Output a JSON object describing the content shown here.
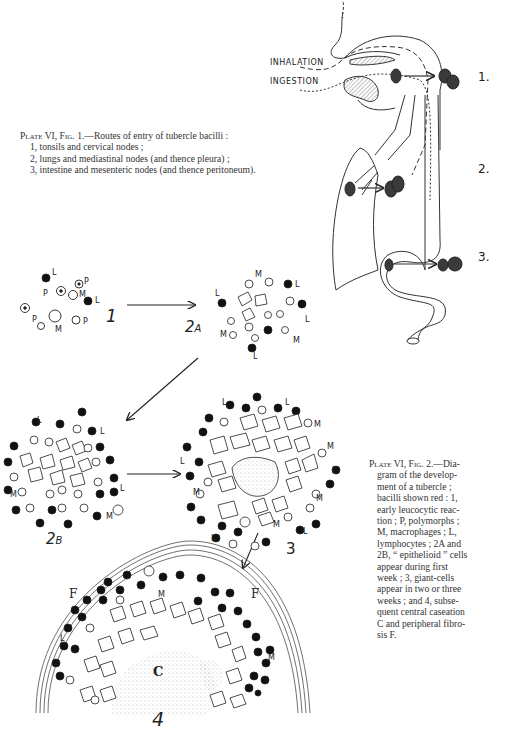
{
  "fig1": {
    "caption_head_plate": "Plate VI,",
    "caption_head_fig": "Fig. 1.",
    "caption_title": "—Routes of entry of tubercle bacilli :",
    "items": [
      "1, tonsils and cervical nodes ;",
      "2, lungs and mediastinal nodes (and thence pleura) ;",
      "3, intestine and mesenteric nodes (and thence peritoneum)."
    ],
    "route_labels": {
      "inhalation": "INHALATION",
      "ingestion": "INGESTION"
    },
    "site_numbers": [
      "1.",
      "2.",
      "3."
    ]
  },
  "fig2": {
    "caption_head_plate": "Plate VI,",
    "caption_head_fig": "Fig. 2.",
    "caption_lines": [
      "—Dia-",
      "gram of the develop-",
      "ment of a tubercle ;",
      "bacilli shown red : 1,",
      "early leucocytic reac-",
      "tion ; P, polymorphs ;",
      "M, macrophages ; L,",
      "lymphocytes ; 2A and",
      "2B, “ epithelioid ” cells",
      "appear during first",
      "week ; 3, giant-cells",
      "appear in two or three",
      "weeks ; and 4, subse-",
      "quent central caseation",
      "C and peripheral fibro-",
      "sis F."
    ],
    "stage_labels": {
      "s1": "1",
      "s2a": "2",
      "s2a_sub": "A",
      "s2b": "2",
      "s2b_sub": "B",
      "s3": "3",
      "s4": "4"
    },
    "cell_letters": {
      "L": "L",
      "P": "P",
      "M": "M",
      "F": "F",
      "C": "C"
    }
  }
}
